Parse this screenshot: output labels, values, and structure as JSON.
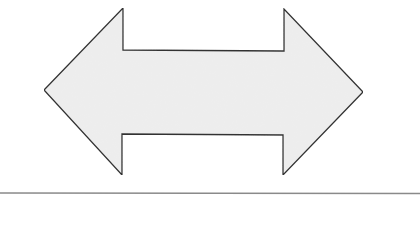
{
  "diagram": {
    "shape": "double-headed-arrow",
    "direction": "left-right",
    "fill": "#eeeeee",
    "stroke": "#333333",
    "points": [
      [
        44,
        90
      ],
      [
        123,
        8
      ],
      [
        123,
        50
      ],
      [
        284,
        51
      ],
      [
        284,
        9
      ],
      [
        363,
        92
      ],
      [
        283,
        175
      ],
      [
        283,
        135
      ],
      [
        122,
        134
      ],
      [
        122,
        175
      ]
    ],
    "divider": {
      "y": 193,
      "color": "#8a8a8a"
    }
  }
}
